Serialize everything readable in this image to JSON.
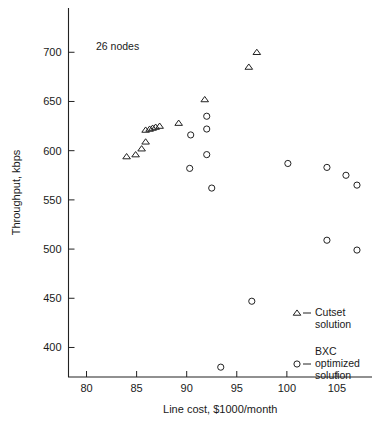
{
  "chart_data": {
    "type": "scatter",
    "title": "",
    "annotation": "26 nodes",
    "xlabel": "Line cost, $1000/month",
    "ylabel": "Throughput, kbps",
    "xlim": [
      78.2,
      108.5
    ],
    "ylim": [
      370,
      745
    ],
    "xticks": [
      80,
      85,
      90,
      95,
      100,
      105
    ],
    "yticks": [
      400,
      450,
      500,
      550,
      600,
      650,
      700
    ],
    "xtick_labels": [
      "80",
      "85",
      "90",
      "95",
      "100",
      "105"
    ],
    "ytick_labels": [
      "400",
      "450",
      "500",
      "550",
      "600",
      "650",
      "700"
    ],
    "grid": false,
    "legend_position": "lower-right",
    "series": [
      {
        "name": "Cutset solution",
        "marker": "triangle",
        "legend_label_line1": "Cutset",
        "legend_label_line2": "solution",
        "points": [
          {
            "x": 84.0,
            "y": 594
          },
          {
            "x": 84.9,
            "y": 596
          },
          {
            "x": 85.5,
            "y": 602
          },
          {
            "x": 85.9,
            "y": 609
          },
          {
            "x": 85.9,
            "y": 621
          },
          {
            "x": 86.3,
            "y": 622
          },
          {
            "x": 86.6,
            "y": 623
          },
          {
            "x": 86.9,
            "y": 624
          },
          {
            "x": 87.3,
            "y": 625
          },
          {
            "x": 89.2,
            "y": 628
          },
          {
            "x": 91.8,
            "y": 652
          },
          {
            "x": 96.2,
            "y": 685
          },
          {
            "x": 97.0,
            "y": 700
          }
        ]
      },
      {
        "name": "BXC optimized solution",
        "marker": "circle",
        "legend_label_line1": "BXC",
        "legend_label_line2": "optimized",
        "legend_label_line3": "solution",
        "points": [
          {
            "x": 90.4,
            "y": 616
          },
          {
            "x": 90.3,
            "y": 582
          },
          {
            "x": 92.0,
            "y": 635
          },
          {
            "x": 92.0,
            "y": 622
          },
          {
            "x": 92.0,
            "y": 596
          },
          {
            "x": 92.5,
            "y": 562
          },
          {
            "x": 93.4,
            "y": 380
          },
          {
            "x": 96.5,
            "y": 447
          },
          {
            "x": 100.1,
            "y": 587
          },
          {
            "x": 104.0,
            "y": 583
          },
          {
            "x": 104.0,
            "y": 509
          },
          {
            "x": 105.9,
            "y": 575
          },
          {
            "x": 107.0,
            "y": 565
          },
          {
            "x": 107.0,
            "y": 499
          }
        ]
      }
    ]
  }
}
